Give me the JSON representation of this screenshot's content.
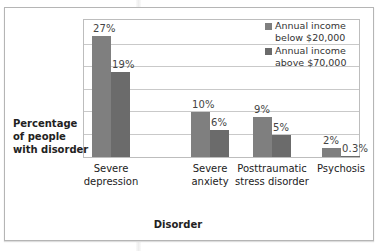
{
  "chart_data": {
    "type": "bar",
    "title": "",
    "xlabel": "Disorder",
    "ylabel": "Percentage of people with disorder",
    "ylim": [
      0,
      30
    ],
    "grid": true,
    "legend_position": "top-right",
    "categories": [
      "Severe depression",
      "Severe anxiety",
      "Posttraumatic stress disorder",
      "Psychosis"
    ],
    "series": [
      {
        "name": "Annual income below $20,000",
        "values": [
          27,
          10,
          9,
          2
        ],
        "labels": [
          "27%",
          "10%",
          "9%",
          "2%"
        ],
        "color": "#7f7f7f"
      },
      {
        "name": "Annual income above $70,000",
        "values": [
          19,
          6,
          5,
          0.3
        ],
        "labels": [
          "19%",
          "6%",
          "5%",
          "0.3%"
        ],
        "color": "#6b6b6b"
      }
    ]
  },
  "labels": {
    "ylabel_lines": [
      "Percentage",
      "of people",
      "with disorder"
    ],
    "xlabel": "Disorder",
    "categories": [
      [
        "Severe",
        "depression"
      ],
      [
        "Severe",
        "anxiety"
      ],
      [
        "Posttraumatic",
        "stress disorder"
      ],
      [
        "Psychosis"
      ]
    ],
    "legend": [
      [
        "Annual income",
        "below $20,000"
      ],
      [
        "Annual income",
        "above $70,000"
      ]
    ]
  }
}
